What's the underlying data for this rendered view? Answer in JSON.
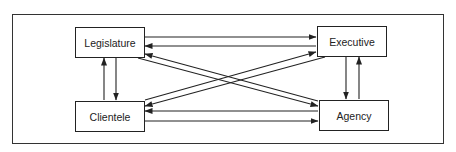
{
  "diagram": {
    "nodes": [
      {
        "id": "legislature",
        "label": "Legislature"
      },
      {
        "id": "executive",
        "label": "Executive"
      },
      {
        "id": "clientele",
        "label": "Clientele"
      },
      {
        "id": "agency",
        "label": "Agency"
      }
    ],
    "edges": [
      {
        "from": "legislature",
        "to": "executive"
      },
      {
        "from": "executive",
        "to": "legislature"
      },
      {
        "from": "clientele",
        "to": "agency"
      },
      {
        "from": "agency",
        "to": "clientele"
      },
      {
        "from": "legislature",
        "to": "clientele"
      },
      {
        "from": "clientele",
        "to": "legislature"
      },
      {
        "from": "executive",
        "to": "agency"
      },
      {
        "from": "agency",
        "to": "executive"
      },
      {
        "from": "legislature",
        "to": "agency"
      },
      {
        "from": "agency",
        "to": "legislature"
      },
      {
        "from": "clientele",
        "to": "executive"
      },
      {
        "from": "executive",
        "to": "clientele"
      }
    ],
    "colors": {
      "line": "#222222",
      "background": "#ffffff"
    }
  }
}
